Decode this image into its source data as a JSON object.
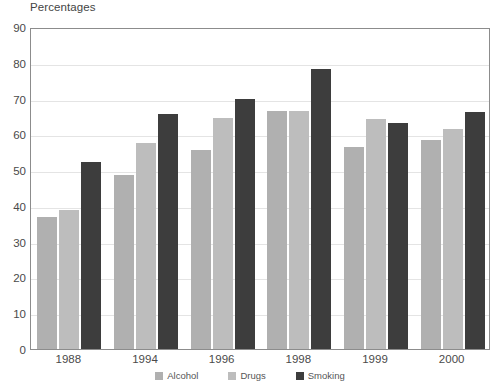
{
  "chart_data": {
    "type": "bar",
    "title": "Percentages",
    "xlabel": "",
    "ylabel": "",
    "ylim": [
      0,
      90
    ],
    "ytick_step": 10,
    "yticks": [
      90,
      80,
      70,
      60,
      50,
      40,
      30,
      20,
      10,
      0
    ],
    "grid": true,
    "legend_position": "bottom-center",
    "categories": [
      "1988",
      "1994",
      "1996",
      "1998",
      "1999",
      "2000"
    ],
    "series": [
      {
        "name": "Alcohol",
        "color": "#b0b0b0",
        "values": [
          36.8,
          48.6,
          55.6,
          66.4,
          56.4,
          58.4
        ]
      },
      {
        "name": "Drugs",
        "color": "#bdbdbd",
        "values": [
          38.8,
          57.7,
          64.5,
          66.4,
          64.3,
          61.4
        ]
      },
      {
        "name": "Smoking",
        "color": "#3d3d3d",
        "values": [
          52.4,
          65.6,
          69.8,
          78.4,
          63.3,
          66.3
        ]
      }
    ]
  },
  "legend": {
    "items": [
      {
        "label": "Alcohol",
        "color": "#b0b0b0"
      },
      {
        "label": "Drugs",
        "color": "#bdbdbd"
      },
      {
        "label": "Smoking",
        "color": "#3d3d3d"
      }
    ]
  }
}
